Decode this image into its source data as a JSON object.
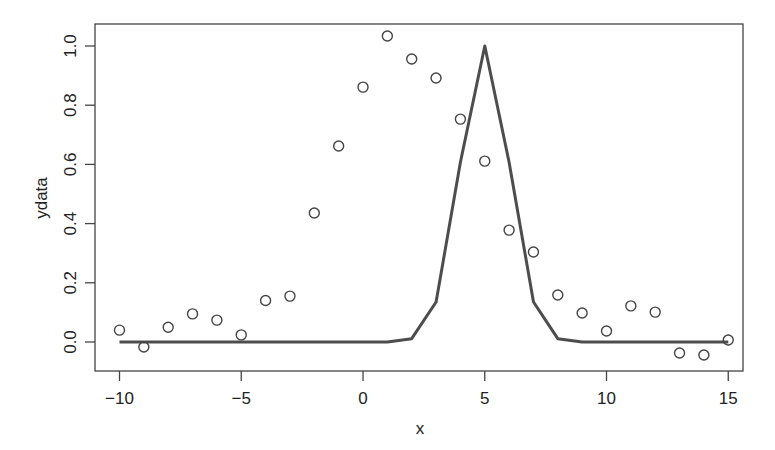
{
  "chart_data": {
    "type": "scatter",
    "title": "",
    "xlabel": "x",
    "ylabel": "ydata",
    "xlim": [
      -11,
      16
    ],
    "ylim": [
      -0.1,
      1.08
    ],
    "grid": false,
    "legend": null,
    "x_ticks": [
      -10,
      -5,
      0,
      5,
      10,
      15
    ],
    "x_tick_labels": [
      "−10",
      "−5",
      "0",
      "5",
      "10",
      "15"
    ],
    "y_ticks": [
      0.0,
      0.2,
      0.4,
      0.6,
      0.8,
      1.0
    ],
    "y_tick_labels": [
      "0.0",
      "0.2",
      "0.4",
      "0.6",
      "0.8",
      "1.0"
    ],
    "series": [
      {
        "name": "ydata",
        "type": "scatter",
        "marker": "open-circle",
        "color": "#444444",
        "x": [
          -10,
          -9,
          -8,
          -7,
          -6,
          -5,
          -4,
          -3,
          -2,
          -1,
          0,
          1,
          2,
          3,
          4,
          5,
          6,
          7,
          8,
          9,
          10,
          11,
          12,
          13,
          14,
          15
        ],
        "values": [
          0.04,
          -0.017,
          0.05,
          0.095,
          0.074,
          0.024,
          0.14,
          0.155,
          0.436,
          0.662,
          0.861,
          1.034,
          0.956,
          0.892,
          0.753,
          0.611,
          0.378,
          0.304,
          0.159,
          0.098,
          0.037,
          0.122,
          0.101,
          -0.037,
          -0.044,
          0.007
        ]
      },
      {
        "name": "fit",
        "type": "line",
        "color": "#4d4d4d",
        "x": [
          -10,
          -9,
          -8,
          -7,
          -6,
          -5,
          -4,
          -3,
          -2,
          -1,
          0,
          1,
          2,
          3,
          4,
          5,
          6,
          7,
          8,
          9,
          10,
          11,
          12,
          13,
          14,
          15
        ],
        "values": [
          0.0,
          0.0,
          0.0,
          0.0,
          0.0,
          0.0,
          0.0,
          0.0,
          0.0,
          0.0,
          0.0,
          0.0,
          0.011,
          0.135,
          0.607,
          1.0,
          0.607,
          0.135,
          0.011,
          0.0,
          0.0,
          0.0,
          0.0,
          0.0,
          0.0,
          0.0
        ]
      }
    ]
  }
}
